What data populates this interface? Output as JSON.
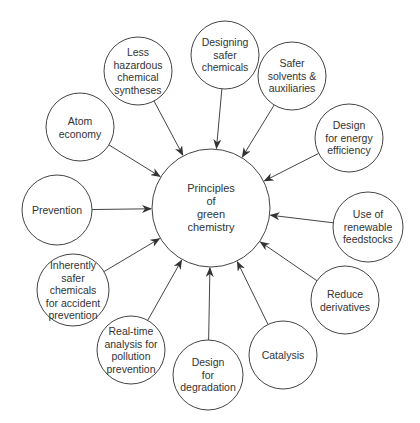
{
  "diagram": {
    "type": "hub-and-spoke",
    "colors": {
      "background": "#ffffff",
      "stroke": "#444444",
      "text": "#333333"
    },
    "center": {
      "label": "Principles\nof\ngreen\nchemistry",
      "cx": 211,
      "cy": 208,
      "r": 59
    },
    "nodes": [
      {
        "id": "designing-safer-chemicals",
        "label": "Designing\nsafer\nchemicals",
        "cx": 225,
        "cy": 55,
        "r": 34
      },
      {
        "id": "less-hazardous-chemical-syntheses",
        "label": "Less\nhazardous\nchemical\nsyntheses",
        "cx": 138,
        "cy": 71,
        "r": 34
      },
      {
        "id": "safer-solvents-auxiliaries",
        "label": "Safer\nsolvents &\nauxiliaries",
        "cx": 292,
        "cy": 76,
        "r": 34
      },
      {
        "id": "atom-economy",
        "label": "Atom\neconomy",
        "cx": 80,
        "cy": 127,
        "r": 34
      },
      {
        "id": "design-for-energy-efficiency",
        "label": "Design\nfor energy\nefficiency",
        "cx": 349,
        "cy": 138,
        "r": 34
      },
      {
        "id": "prevention",
        "label": "Prevention",
        "cx": 57,
        "cy": 210,
        "r": 35
      },
      {
        "id": "use-of-renewable-feedstocks",
        "label": "Use of\nrenewable\nfeedstocks",
        "cx": 368,
        "cy": 227,
        "r": 35
      },
      {
        "id": "inherently-safer-chemicals",
        "label": "Inherently\nsafer\nchemicals\nfor accident\nprevention",
        "cx": 73,
        "cy": 290,
        "r": 36
      },
      {
        "id": "reduce-derivatives",
        "label": "Reduce\nderivatives",
        "cx": 345,
        "cy": 300,
        "r": 34
      },
      {
        "id": "real-time-analysis",
        "label": "Real-time\nanalysis for\npollution\nprevention",
        "cx": 131,
        "cy": 350,
        "r": 34
      },
      {
        "id": "catalysis",
        "label": "Catalysis",
        "cx": 283,
        "cy": 355,
        "r": 34
      },
      {
        "id": "design-for-degradation",
        "label": "Design\nfor\ndegradation",
        "cx": 208,
        "cy": 375,
        "r": 35
      }
    ]
  }
}
